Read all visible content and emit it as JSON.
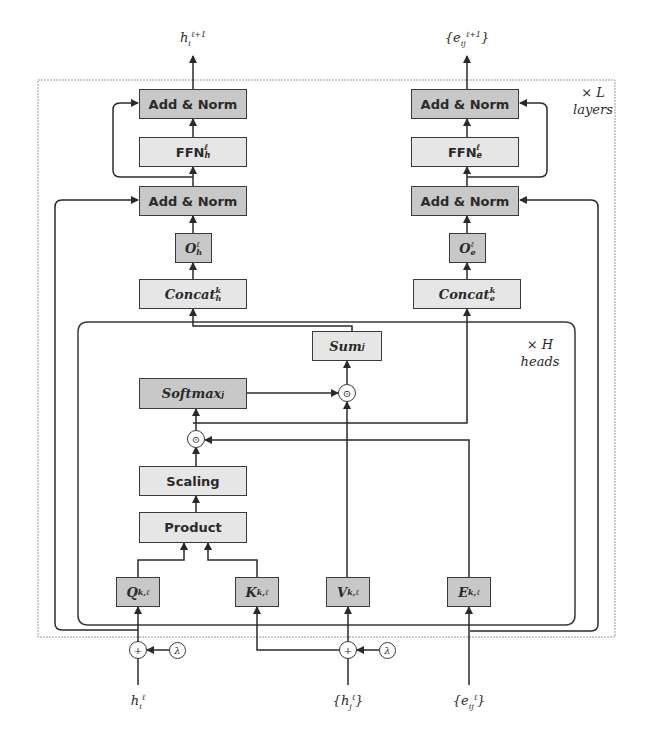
{
  "diagram": {
    "outputs": {
      "node": "h_i^{ℓ+1}",
      "edge": "{e_ij^{ℓ+1}}"
    },
    "inputs": {
      "node_i": "h_i^ℓ",
      "nodes_j": "{h_j^ℓ}",
      "edges": "{e_ij^ℓ}",
      "lambda": "λ"
    },
    "repeat_layers": {
      "times": "× L",
      "label": "layers"
    },
    "repeat_heads": {
      "times": "× H",
      "label": "heads"
    },
    "node_branch": {
      "add_norm_top": "Add & Norm",
      "ffn": "FFN",
      "ffn_sub": "h",
      "add_norm_bottom": "Add & Norm",
      "output_proj": "O",
      "output_proj_sub": "h",
      "concat": "Concat",
      "concat_sub": "h"
    },
    "edge_branch": {
      "add_norm_top": "Add & Norm",
      "ffn": "FFN",
      "ffn_sub": "e",
      "add_norm_bottom": "Add & Norm",
      "output_proj": "O",
      "output_proj_sub": "e",
      "concat": "Concat",
      "concat_sub": "e"
    },
    "attention": {
      "sum": "Sum",
      "sum_sub": "j",
      "softmax": "Softmax",
      "softmax_sub": "j",
      "scaling": "Scaling",
      "product": "Product",
      "q": "Q",
      "k": "K",
      "v": "V",
      "e": "E",
      "kl_sup": "k,ℓ",
      "odot": "⊙",
      "plus": "+"
    },
    "superscripts": {
      "layer": "ℓ",
      "head": "k",
      "next": "ℓ+1"
    },
    "colors": {
      "dark_box": "#c8c8c8",
      "light_box": "#e6e6e6",
      "line": "#3a3a3a",
      "dashed_frame": "#9a9a9a"
    }
  }
}
